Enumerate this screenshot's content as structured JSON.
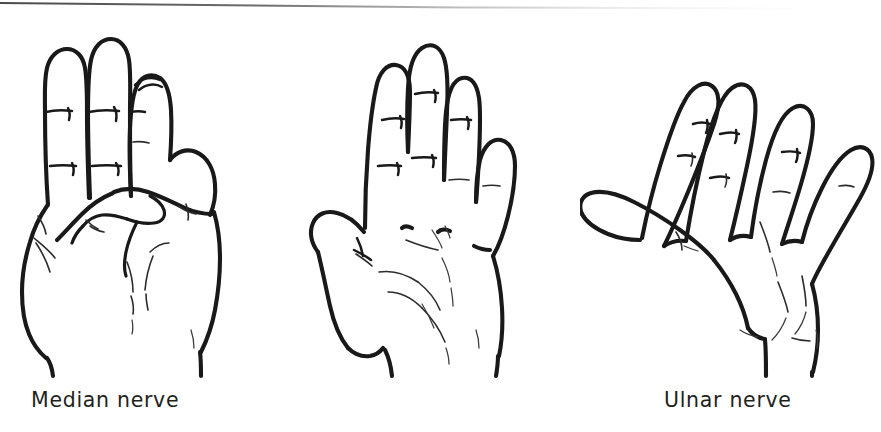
{
  "figure": {
    "background_color": "#ffffff",
    "ink_color": "#191919",
    "caption_color": "#231f20",
    "width": 881,
    "height": 432
  },
  "scan_artifact": {
    "name": "top-scan-edge-line",
    "description": "thin gray scan edge line across the top of the page, darkest at left, fading to the right",
    "color": "#6a6a6a"
  },
  "panels": [
    {
      "id": "median",
      "label": "Median nerve",
      "posture": "index and middle fingers extended, ring and little fingers flexed, thumb folded across palm",
      "view": "dorsal / side view of closed hand with two fingers up"
    },
    {
      "id": "ulnar",
      "label": "Ulnar nerve",
      "posture": "open palm, fingers held together and extended, thumb abducted",
      "view": "palmar view"
    },
    {
      "id": "radial",
      "label": "Radial nerve",
      "posture": "open palm, all fingers and thumb widely splayed and extended",
      "view": "palmar view"
    }
  ]
}
